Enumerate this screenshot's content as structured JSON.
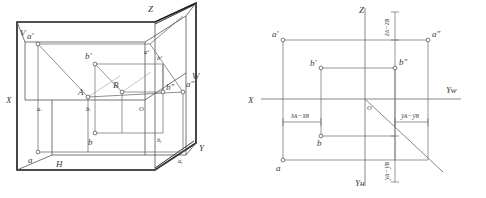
{
  "figure": {
    "title": "",
    "kind": "descriptive-geometry-projection-pair",
    "panels": [
      {
        "id": "pictorial",
        "caption": ""
      },
      {
        "id": "orthographic",
        "caption": ""
      }
    ]
  },
  "left_panel": {
    "axis_labels": {
      "x": "X",
      "y": "Y",
      "z": "Z",
      "plane_v": "V",
      "plane_h": "H",
      "plane_w": "W",
      "origin": "O"
    },
    "point_labels": {
      "a_front": "a'",
      "a_top": "a",
      "a_side": "a″",
      "a_x": "aₓ",
      "a_y": "aᵧ",
      "a_z": "aᶻ",
      "A": "A",
      "b_front": "b'",
      "b_top": "b",
      "b_side": "b″",
      "b_x": "bₓ",
      "b_y": "bᵧ",
      "b_z": "bᶻ",
      "B": "B"
    }
  },
  "right_panel": {
    "axis_labels": {
      "x": "X",
      "z": "Z",
      "y_w": "Yᴡ",
      "y_h": "Yʜ",
      "origin": "O"
    },
    "point_labels": {
      "a_front": "a'",
      "a_top": "a",
      "a_side": "a″",
      "b_front": "b'",
      "b_top": "b",
      "b_side": "b″"
    },
    "dimensions": {
      "dx": "xᴀ−xʙ",
      "dy_right": "yᴀ−yʙ",
      "dy_bottom": "yᴀ−yʙ",
      "dz": "zᴀ−zʙ"
    }
  },
  "style": {
    "line_color": "#555555",
    "heavy_line_color": "#1a1a1a",
    "marker_fill": "#ffffff",
    "text_color": "#3a3a3a",
    "background": "#ffffff"
  }
}
